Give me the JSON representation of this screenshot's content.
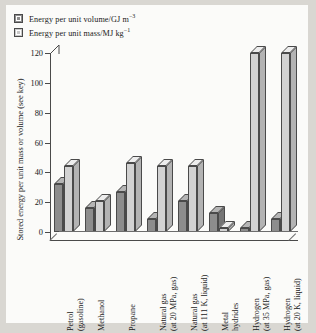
{
  "legend": {
    "position": "top-left",
    "items": [
      {
        "key": "volume",
        "label_main": "Energy per unit volume/GJ m",
        "label_sup": "−3",
        "swatch_color": "#8d8d8d",
        "icon": "legend-swatch-icon"
      },
      {
        "key": "mass",
        "label_main": "Energy per unit mass/MJ kg",
        "label_sup": "−1",
        "swatch_color": "#d2d2d2",
        "icon": "legend-swatch-icon"
      }
    ]
  },
  "axis": {
    "y_title": "Stored energy per unit mass or volume (see key)",
    "y_ticks": [
      "0",
      "20",
      "40",
      "60",
      "80",
      "100",
      "120"
    ]
  },
  "categories": [
    {
      "line1": "Petrol",
      "line2": "(gasoline)"
    },
    {
      "line1": "Methanol",
      "line2": ""
    },
    {
      "line1": "Propane",
      "line2": ""
    },
    {
      "line1": "Natural gas",
      "line2": "(at 20 MPa, gas)"
    },
    {
      "line1": "Natural gas",
      "line2": "(at 111 K, liquid)"
    },
    {
      "line1": "Metal",
      "line2": "hydrides"
    },
    {
      "line1": "Hydrogen",
      "line2": "(at 35 MPa, gas)"
    },
    {
      "line1": "Hydrogen",
      "line2": "(at 20 K, liquid)"
    }
  ],
  "chart_data": {
    "type": "bar",
    "title": "",
    "xlabel": "",
    "ylabel": "Stored energy per unit mass or volume (see key)",
    "ylim": [
      0,
      120
    ],
    "ytick_step": 20,
    "grid": false,
    "legend_position": "top-left",
    "style": "3d-grouped-bar-grayscale",
    "categories": [
      "Petrol (gasoline)",
      "Methanol",
      "Propane",
      "Natural gas (at 20 MPa, gas)",
      "Natural gas (at 111 K, liquid)",
      "Metal hydrides",
      "Hydrogen (at 35 MPa, gas)",
      "Hydrogen (at 20 K, liquid)"
    ],
    "series": [
      {
        "name": "Energy per unit volume/GJ m−3",
        "color": "#8d8d8d",
        "values": [
          32,
          16,
          27,
          9,
          21,
          13,
          3,
          9
        ]
      },
      {
        "name": "Energy per unit mass/MJ kg−1",
        "color": "#d2d2d2",
        "values": [
          44,
          21,
          46,
          44,
          44,
          2.5,
          120,
          120
        ]
      }
    ]
  }
}
